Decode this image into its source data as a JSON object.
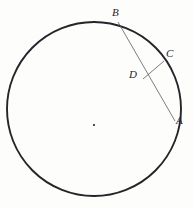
{
  "figure": {
    "background_color": "#fdfdfc",
    "stroke_color": "#26242a",
    "chord_color": "#5d5a60",
    "labels": {
      "A": "A",
      "B": "B",
      "C": "C",
      "D": "D"
    },
    "geometry": {
      "circle": {
        "center_x": 94,
        "center_y": 109,
        "radius": 87,
        "stroke_width": 1.9
      },
      "center_dot": {
        "x": 94,
        "y": 125,
        "radius": 1.1
      },
      "chord_AB": {
        "x1": 118,
        "y1": 22,
        "x2": 175,
        "y2": 121,
        "stroke_width": 0.8
      },
      "segment_DC": {
        "x1": 143,
        "y1": 79,
        "x2": 164,
        "y2": 61,
        "stroke_width": 0.8
      },
      "segment_BC": {
        "x1": 118,
        "y1": 22,
        "x2": 164,
        "y2": 61,
        "stroke_width": 0.0
      }
    }
  }
}
